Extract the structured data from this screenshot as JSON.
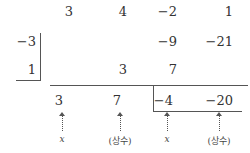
{
  "rows": {
    "coefficients": [
      "3",
      "4",
      "−2",
      "1"
    ],
    "divisor1": "−3",
    "row1": [
      "",
      "",
      "−9",
      "−21"
    ],
    "divisor2": "1",
    "row2": [
      "",
      "3",
      "7",
      ""
    ],
    "result": [
      "3",
      "7",
      "−4",
      "−20"
    ]
  },
  "labels": [
    "x",
    "(상수)",
    "x",
    "(상수)"
  ]
}
